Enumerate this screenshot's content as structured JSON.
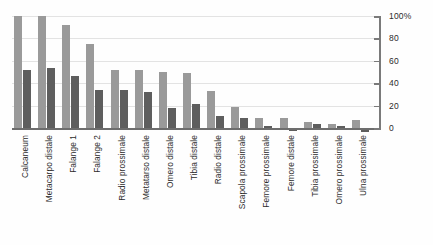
{
  "chart_data": {
    "type": "bar",
    "title": "",
    "subtitle": "",
    "xlabel": "",
    "ylabel": "",
    "ylim": [
      -10,
      100
    ],
    "yticks": [
      0,
      20,
      40,
      60,
      80,
      100
    ],
    "ytick_labels": [
      "0",
      "20",
      "40",
      "60",
      "80",
      "100%"
    ],
    "grid": true,
    "legend": "none",
    "orientation": "vertical",
    "categories": [
      "Calcaneum",
      "Metacarpo distale",
      "Falange 1",
      "Falange 2",
      "Radio prossimale",
      "Metatarso distale",
      "Omero distale",
      "Tibia distale",
      "Radio distale",
      "Scapola prossimale",
      "Femore prossimale",
      "Femore distale",
      "Tibia prossimale",
      "Omero prossimale",
      "Ulna prossimale"
    ],
    "series": [
      {
        "name": "serie-1",
        "color": "#9a9a9a",
        "values": [
          100,
          100,
          92,
          75,
          52,
          52,
          50,
          49,
          33,
          19,
          9,
          9,
          5,
          4,
          7
        ]
      },
      {
        "name": "serie-2",
        "color": "#5e5e5e",
        "values": [
          52,
          54,
          46,
          34,
          34,
          32,
          18,
          21,
          11,
          9,
          2,
          -3,
          4,
          2,
          -4
        ]
      }
    ]
  },
  "colors": {
    "series1": "#9a9a9a",
    "series2": "#5e5e5e",
    "gridline": "#e3e3e3",
    "axis": "#7a7a7a",
    "text": "#2b2b2b",
    "background": "#fefefe"
  }
}
